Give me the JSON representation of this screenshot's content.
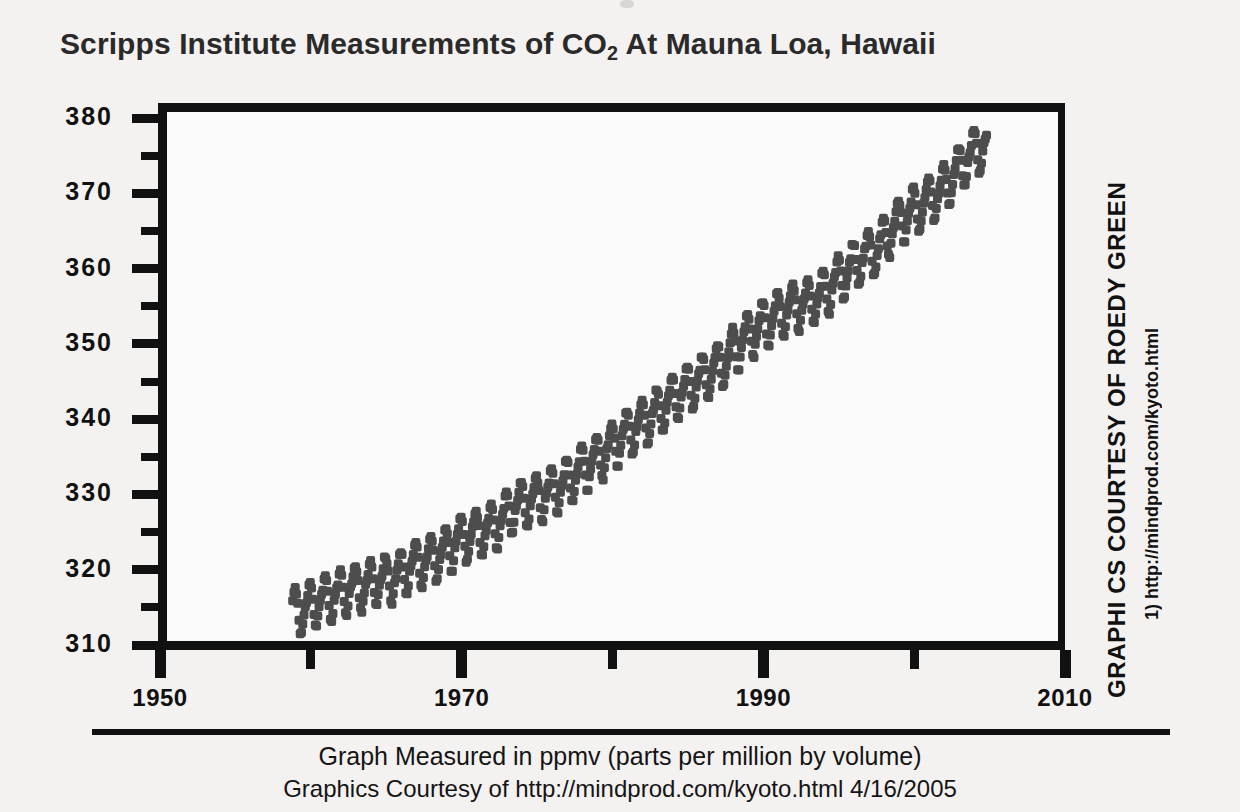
{
  "title": {
    "before": "Scripps Institute Measurements of CO",
    "sub": "2",
    "after": " At Mauna Loa, Hawaii",
    "full": "Scripps Institute Measurements of CO2 At Mauna Loa, Hawaii"
  },
  "credits": {
    "vertical_main": "GRAPHI CS COURTESY OF ROEDY GREEN",
    "vertical_url": "1) http://mindprod.com/kyoto.html"
  },
  "caption": {
    "line1": "Graph Measured in ppmv (parts per million by volume)",
    "line2": "Graphics Courtesy of http://mindprod.com/kyoto.html 4/16/2005"
  },
  "colors": {
    "background": "#f4f2f0",
    "axis": "#111111",
    "marker": "#4d4d4d",
    "plot_background": "#fbfafa"
  },
  "chart_data": {
    "type": "scatter",
    "title": "Scripps Institute Measurements of CO2 At Mauna Loa, Hawaii",
    "subtitle": "Graph Measured in ppmv (parts per million by volume)",
    "xlabel": "",
    "ylabel": "",
    "xlim": [
      1950,
      2010
    ],
    "ylim": [
      308,
      383
    ],
    "grid": false,
    "legend": null,
    "x_tick_labels": [
      "1950",
      "1970",
      "1990",
      "2010"
    ],
    "x_major_ticks": [
      1950,
      1970,
      1990,
      2010
    ],
    "x_minor_ticks": [
      1960,
      1980,
      2000
    ],
    "y_tick_labels": [
      "310",
      "320",
      "330",
      "340",
      "350",
      "360",
      "370",
      "380"
    ],
    "y_major_ticks": [
      310,
      320,
      330,
      340,
      350,
      360,
      370,
      380
    ],
    "y_minor_ticks": [
      315,
      325,
      335,
      345,
      355,
      365,
      375
    ],
    "units": "ppmv",
    "series_name": "Monthly mean CO2 concentration",
    "marker_shape": "square",
    "marker_size_px": 9,
    "sampling": "monthly",
    "seasonal_amplitude_ppm": 3.1,
    "data_start_year": 1958.2,
    "data_end_year": 2004.2,
    "annual_means": [
      {
        "year": 1958,
        "value": 315.3
      },
      {
        "year": 1959,
        "value": 315.98
      },
      {
        "year": 1960,
        "value": 316.91
      },
      {
        "year": 1961,
        "value": 317.64
      },
      {
        "year": 1962,
        "value": 318.45
      },
      {
        "year": 1963,
        "value": 318.99
      },
      {
        "year": 1964,
        "value": 319.62
      },
      {
        "year": 1965,
        "value": 320.04
      },
      {
        "year": 1966,
        "value": 321.38
      },
      {
        "year": 1967,
        "value": 322.16
      },
      {
        "year": 1968,
        "value": 323.04
      },
      {
        "year": 1969,
        "value": 324.62
      },
      {
        "year": 1970,
        "value": 325.68
      },
      {
        "year": 1971,
        "value": 326.32
      },
      {
        "year": 1972,
        "value": 327.45
      },
      {
        "year": 1973,
        "value": 329.68
      },
      {
        "year": 1974,
        "value": 330.17
      },
      {
        "year": 1975,
        "value": 331.08
      },
      {
        "year": 1976,
        "value": 332.05
      },
      {
        "year": 1977,
        "value": 333.78
      },
      {
        "year": 1978,
        "value": 335.41
      },
      {
        "year": 1979,
        "value": 336.78
      },
      {
        "year": 1980,
        "value": 338.68
      },
      {
        "year": 1981,
        "value": 340.1
      },
      {
        "year": 1982,
        "value": 341.44
      },
      {
        "year": 1983,
        "value": 343.03
      },
      {
        "year": 1984,
        "value": 344.58
      },
      {
        "year": 1985,
        "value": 346.04
      },
      {
        "year": 1986,
        "value": 347.39
      },
      {
        "year": 1987,
        "value": 349.16
      },
      {
        "year": 1988,
        "value": 351.56
      },
      {
        "year": 1989,
        "value": 353.07
      },
      {
        "year": 1990,
        "value": 354.35
      },
      {
        "year": 1991,
        "value": 355.57
      },
      {
        "year": 1992,
        "value": 356.38
      },
      {
        "year": 1993,
        "value": 357.07
      },
      {
        "year": 1994,
        "value": 358.82
      },
      {
        "year": 1995,
        "value": 360.8
      },
      {
        "year": 1996,
        "value": 362.59
      },
      {
        "year": 1997,
        "value": 363.71
      },
      {
        "year": 1998,
        "value": 366.65
      },
      {
        "year": 1999,
        "value": 368.33
      },
      {
        "year": 2000,
        "value": 369.52
      },
      {
        "year": 2001,
        "value": 371.13
      },
      {
        "year": 2002,
        "value": 373.22
      },
      {
        "year": 2003,
        "value": 375.77
      },
      {
        "year": 2004,
        "value": 377.49
      }
    ],
    "monthly_seasonal_offsets": [
      0.2,
      0.9,
      1.6,
      2.9,
      3.1,
      2.4,
      0.9,
      -1.1,
      -2.9,
      -3.1,
      -1.9,
      -0.6
    ]
  }
}
